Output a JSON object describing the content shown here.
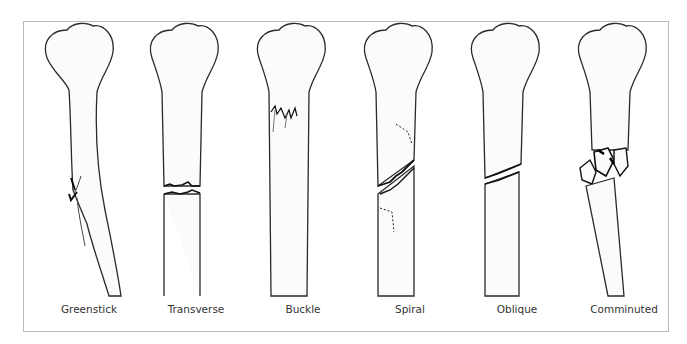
{
  "figure": {
    "type": "fracture-types-illustration",
    "items": [
      {
        "label": "Greenstick",
        "pattern": "incomplete bend fracture on one cortex, bone bowed"
      },
      {
        "label": "Transverse",
        "pattern": "horizontal complete break across shaft"
      },
      {
        "label": "Buckle",
        "pattern": "compressed cortex near metaphysis"
      },
      {
        "label": "Spiral",
        "pattern": "oblique break with dashed spiral lines"
      },
      {
        "label": "Oblique",
        "pattern": "angled complete break across shaft"
      },
      {
        "label": "Comminuted",
        "pattern": "multiple fragments at fracture site"
      }
    ]
  },
  "colors": {
    "outline": "#2a2a2a",
    "fracture": "#111111",
    "frame": "#b9b9b9",
    "label": "#333333",
    "bone_fill": "#fbfbfb"
  }
}
